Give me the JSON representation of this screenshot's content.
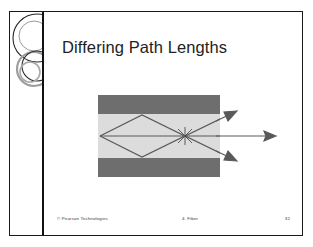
{
  "slide": {
    "title": "Differing Path Lengths",
    "footer": {
      "copyright": "© Pearson Technologies",
      "section": "4. Fiber",
      "page_number": "32"
    },
    "decoration": {
      "name": "overlapping-circles-ornament"
    },
    "diagram": {
      "name": "multimode-fiber-ray-paths",
      "description": "Cross-section of a multimode optical fiber showing three light rays of differing path lengths exiting the fiber end",
      "colors": {
        "cladding": "#6e6e6e",
        "core": "#dcdcdc",
        "ray": "#595959",
        "background": "#ffffff"
      },
      "rays": [
        {
          "label": "high-angle-ray-upper",
          "path": "zigzag reflecting off upper then lower cladding"
        },
        {
          "label": "axial-ray",
          "path": "straight along fiber axis"
        },
        {
          "label": "high-angle-ray-lower",
          "path": "zigzag reflecting off lower then upper cladding"
        }
      ],
      "arrows": [
        {
          "name": "exit-arrow-upper"
        },
        {
          "name": "exit-arrow-axial"
        },
        {
          "name": "exit-arrow-lower"
        }
      ]
    }
  }
}
